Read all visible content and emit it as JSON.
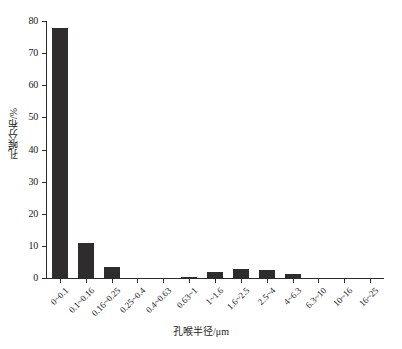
{
  "chart_data": {
    "type": "bar",
    "title": "",
    "xlabel": "孔喉半径/μm",
    "ylabel": "孔喉分布/%",
    "categories": [
      "0~0.1",
      "0.1~0.16",
      "0.16~0.25",
      "0.25~0.4",
      "0.4~0.63",
      "0.63~1",
      "1~1.6",
      "1.6~2.5",
      "2.5~4",
      "4~6.3",
      "6.3~10",
      "10~16",
      "16~25"
    ],
    "values": [
      77.8,
      10.9,
      3.4,
      0,
      0,
      0.3,
      1.8,
      2.7,
      2.4,
      1.4,
      0,
      0,
      0
    ],
    "ylim": [
      0,
      80
    ],
    "yticks": [
      0,
      10,
      20,
      30,
      40,
      50,
      60,
      70,
      80
    ],
    "ytick_labels": [
      "0",
      "10",
      "20",
      "30",
      "40",
      "50",
      "60",
      "70",
      "80"
    ],
    "grid": false,
    "legend": null,
    "bar_color": "#2e2c2d",
    "axis_color": "#2b2b2b",
    "xtick_rotation": -45
  }
}
